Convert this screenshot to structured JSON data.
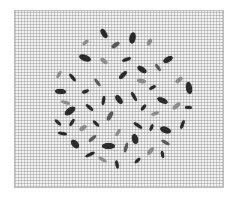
{
  "image": {
    "description": "Grayscale photograph of elongated seeds scattered in a roughly circular cluster on grid paper",
    "paper": {
      "x": 14,
      "y": 10,
      "w": 210,
      "h": 178,
      "color": "#f2f2f2",
      "grid_color": "#8a8a8a"
    },
    "seed_colors": {
      "dark": "#2a2a2a",
      "mid": "#5a5a5a",
      "light": "#8c8c8c"
    },
    "seeds": [
      {
        "x": 104,
        "y": 33,
        "w": 10,
        "h": 5,
        "r": 60,
        "c": "dark"
      },
      {
        "x": 132,
        "y": 38,
        "w": 11,
        "h": 6,
        "r": -80,
        "c": "dark"
      },
      {
        "x": 85,
        "y": 42,
        "w": 7,
        "h": 3,
        "r": -40,
        "c": "light"
      },
      {
        "x": 115,
        "y": 45,
        "w": 9,
        "h": 4,
        "r": -35,
        "c": "mid"
      },
      {
        "x": 149,
        "y": 42,
        "w": 7,
        "h": 4,
        "r": -60,
        "c": "light"
      },
      {
        "x": 85,
        "y": 58,
        "w": 12,
        "h": 6,
        "r": 20,
        "c": "dark"
      },
      {
        "x": 104,
        "y": 61,
        "w": 8,
        "h": 4,
        "r": 40,
        "c": "light"
      },
      {
        "x": 126,
        "y": 59,
        "w": 9,
        "h": 3,
        "r": -20,
        "c": "dark"
      },
      {
        "x": 168,
        "y": 59,
        "w": 10,
        "h": 5,
        "r": -30,
        "c": "dark"
      },
      {
        "x": 142,
        "y": 69,
        "w": 10,
        "h": 5,
        "r": 35,
        "c": "dark"
      },
      {
        "x": 158,
        "y": 67,
        "w": 8,
        "h": 3,
        "r": 55,
        "c": "mid"
      },
      {
        "x": 59,
        "y": 74,
        "w": 8,
        "h": 3,
        "r": -60,
        "c": "light"
      },
      {
        "x": 72,
        "y": 77,
        "w": 9,
        "h": 3,
        "r": 50,
        "c": "dark"
      },
      {
        "x": 123,
        "y": 75,
        "w": 10,
        "h": 4,
        "r": -45,
        "c": "dark"
      },
      {
        "x": 97,
        "y": 82,
        "w": 9,
        "h": 3,
        "r": 55,
        "c": "mid"
      },
      {
        "x": 141,
        "y": 81,
        "w": 9,
        "h": 4,
        "r": 10,
        "c": "light"
      },
      {
        "x": 179,
        "y": 80,
        "w": 8,
        "h": 4,
        "r": -40,
        "c": "light"
      },
      {
        "x": 189,
        "y": 88,
        "w": 12,
        "h": 6,
        "r": 80,
        "c": "dark"
      },
      {
        "x": 152,
        "y": 87,
        "w": 7,
        "h": 3,
        "r": -30,
        "c": "dark"
      },
      {
        "x": 60,
        "y": 91,
        "w": 11,
        "h": 5,
        "r": 5,
        "c": "dark"
      },
      {
        "x": 85,
        "y": 91,
        "w": 7,
        "h": 3,
        "r": -20,
        "c": "dark"
      },
      {
        "x": 119,
        "y": 99,
        "w": 10,
        "h": 5,
        "r": 55,
        "c": "dark"
      },
      {
        "x": 134,
        "y": 96,
        "w": 10,
        "h": 3,
        "r": 60,
        "c": "dark"
      },
      {
        "x": 103,
        "y": 100,
        "w": 9,
        "h": 3,
        "r": -80,
        "c": "dark"
      },
      {
        "x": 162,
        "y": 100,
        "w": 11,
        "h": 5,
        "r": 25,
        "c": "dark"
      },
      {
        "x": 65,
        "y": 102,
        "w": 9,
        "h": 3,
        "r": 15,
        "c": "light"
      },
      {
        "x": 176,
        "y": 106,
        "w": 9,
        "h": 4,
        "r": -40,
        "c": "light"
      },
      {
        "x": 70,
        "y": 111,
        "w": 12,
        "h": 6,
        "r": -35,
        "c": "dark"
      },
      {
        "x": 89,
        "y": 107,
        "w": 9,
        "h": 3,
        "r": 40,
        "c": "dark"
      },
      {
        "x": 143,
        "y": 107,
        "w": 7,
        "h": 3,
        "r": -50,
        "c": "dark"
      },
      {
        "x": 188,
        "y": 107,
        "w": 7,
        "h": 3,
        "r": 5,
        "c": "dark"
      },
      {
        "x": 110,
        "y": 116,
        "w": 10,
        "h": 4,
        "r": -60,
        "c": "mid"
      },
      {
        "x": 155,
        "y": 113,
        "w": 8,
        "h": 3,
        "r": -20,
        "c": "light"
      },
      {
        "x": 58,
        "y": 122,
        "w": 8,
        "h": 3,
        "r": 45,
        "c": "dark"
      },
      {
        "x": 72,
        "y": 122,
        "w": 8,
        "h": 3,
        "r": -60,
        "c": "dark"
      },
      {
        "x": 96,
        "y": 123,
        "w": 8,
        "h": 3,
        "r": 45,
        "c": "dark"
      },
      {
        "x": 138,
        "y": 125,
        "w": 10,
        "h": 3,
        "r": 35,
        "c": "dark"
      },
      {
        "x": 182,
        "y": 124,
        "w": 9,
        "h": 3,
        "r": -70,
        "c": "dark"
      },
      {
        "x": 83,
        "y": 128,
        "w": 8,
        "h": 4,
        "r": -35,
        "c": "light"
      },
      {
        "x": 151,
        "y": 127,
        "w": 7,
        "h": 3,
        "r": -70,
        "c": "dark"
      },
      {
        "x": 165,
        "y": 130,
        "w": 11,
        "h": 6,
        "r": 20,
        "c": "dark"
      },
      {
        "x": 62,
        "y": 133,
        "w": 9,
        "h": 3,
        "r": 10,
        "c": "dark"
      },
      {
        "x": 118,
        "y": 132,
        "w": 8,
        "h": 3,
        "r": -60,
        "c": "light"
      },
      {
        "x": 92,
        "y": 138,
        "w": 9,
        "h": 3,
        "r": -40,
        "c": "mid"
      },
      {
        "x": 135,
        "y": 139,
        "w": 10,
        "h": 6,
        "r": 75,
        "c": "dark"
      },
      {
        "x": 165,
        "y": 142,
        "w": 9,
        "h": 3,
        "r": 30,
        "c": "mid"
      },
      {
        "x": 75,
        "y": 144,
        "w": 10,
        "h": 6,
        "r": 50,
        "c": "dark"
      },
      {
        "x": 108,
        "y": 146,
        "w": 13,
        "h": 6,
        "r": 0,
        "c": "dark"
      },
      {
        "x": 126,
        "y": 147,
        "w": 10,
        "h": 3,
        "r": -75,
        "c": "mid"
      },
      {
        "x": 150,
        "y": 151,
        "w": 9,
        "h": 4,
        "r": -50,
        "c": "light"
      },
      {
        "x": 90,
        "y": 154,
        "w": 10,
        "h": 3,
        "r": -25,
        "c": "dark"
      },
      {
        "x": 162,
        "y": 154,
        "w": 7,
        "h": 3,
        "r": 80,
        "c": "dark"
      },
      {
        "x": 102,
        "y": 159,
        "w": 9,
        "h": 3,
        "r": 30,
        "c": "light"
      },
      {
        "x": 137,
        "y": 160,
        "w": 7,
        "h": 3,
        "r": -45,
        "c": "dark"
      },
      {
        "x": 117,
        "y": 164,
        "w": 8,
        "h": 3,
        "r": 80,
        "c": "dark"
      },
      {
        "x": 120,
        "y": 115,
        "w": 0,
        "h": 0,
        "r": 0,
        "c": "light"
      }
    ]
  }
}
